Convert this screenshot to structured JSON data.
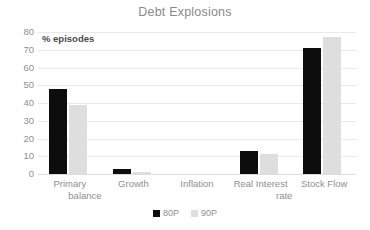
{
  "chart_data": {
    "type": "bar",
    "title": "Debt Explosions",
    "subtitle": "",
    "xlabel": "",
    "ylabel": "% episodes",
    "ylim": [
      0,
      80
    ],
    "yticks": [
      0,
      10,
      20,
      30,
      40,
      50,
      60,
      70,
      80
    ],
    "ytick_labels": [
      "0",
      "10",
      "20",
      "30",
      "40",
      "50",
      "60",
      "70",
      "80"
    ],
    "grid": true,
    "legend_position": "bottom",
    "categories": [
      "Primary balance",
      "Growth",
      "Inflation",
      "Real Interest rate",
      "Stock Flow"
    ],
    "category_lines": [
      [
        "Primary",
        "balance"
      ],
      [
        "Growth"
      ],
      [
        "Inflation"
      ],
      [
        "Real Interest",
        "rate"
      ],
      [
        "Stock Flow"
      ]
    ],
    "series": [
      {
        "name": "80P",
        "color": "#0d0d0d",
        "values": [
          48,
          3,
          0,
          13,
          71
        ]
      },
      {
        "name": "90P",
        "color": "#dedede",
        "values": [
          39,
          1,
          0,
          11,
          77
        ]
      }
    ],
    "annotations": [
      "% episodes"
    ]
  },
  "colors": {
    "background": "#ffffff",
    "title": "#8a8a8a",
    "tick_text": "#8f8f8f",
    "gridline": "#e9e9e9",
    "series_80p": "#0d0d0d",
    "series_90p": "#dedede"
  }
}
